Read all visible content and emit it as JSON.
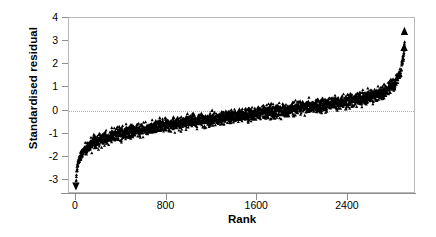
{
  "chart_data": {
    "type": "scatter",
    "title": "",
    "xlabel": "Rank",
    "ylabel": "Standardised residual",
    "xlim": [
      -60,
      3000
    ],
    "ylim": [
      -3.6,
      4.0
    ],
    "grid": false,
    "zero_reference_line": 0,
    "legend": null,
    "xticks": [
      {
        "value": 0,
        "label": "0"
      },
      {
        "value": 800,
        "label": "800"
      },
      {
        "value": 1600,
        "label": "1600"
      },
      {
        "value": 2400,
        "label": "2400"
      }
    ],
    "yticks": [
      {
        "value": 4,
        "label": "4"
      },
      {
        "value": 3,
        "label": "3"
      },
      {
        "value": 2,
        "label": "2"
      },
      {
        "value": 1,
        "label": "1"
      },
      {
        "value": 0,
        "label": "0"
      },
      {
        "value": -1,
        "label": "-1"
      },
      {
        "value": -2,
        "label": "-2"
      },
      {
        "value": -3,
        "label": "-3"
      }
    ],
    "n_points": 2900,
    "marker": "filled-triangle",
    "marker_color": "#000000",
    "band_half_width": 0.21,
    "series": [
      {
        "name": "Standardised residual (ranked)",
        "description": "Dense monotonically increasing band of ranked standardised residuals forming an S-shaped ogive from approximately -3.2 at rank 1 to approximately +3.5 at the highest rank.",
        "control_points_x": [
          0,
          10,
          25,
          50,
          90,
          150,
          240,
          380,
          560,
          800,
          1100,
          1450,
          1800,
          2100,
          2350,
          2550,
          2700,
          2800,
          2860,
          2890,
          2900
        ],
        "control_points_y": [
          -3.2,
          -2.55,
          -2.15,
          -1.85,
          -1.62,
          -1.42,
          -1.2,
          -1.0,
          -0.82,
          -0.62,
          -0.4,
          -0.2,
          0.0,
          0.18,
          0.36,
          0.56,
          0.78,
          1.1,
          1.6,
          2.3,
          2.95
        ]
      }
    ],
    "outliers": [
      {
        "rank": 1,
        "value": -3.25,
        "marker": "triangle-down"
      },
      {
        "rank": 2895,
        "value": 2.72,
        "marker": "triangle-up"
      },
      {
        "rank": 2898,
        "value": 3.42,
        "marker": "triangle-up"
      }
    ]
  }
}
